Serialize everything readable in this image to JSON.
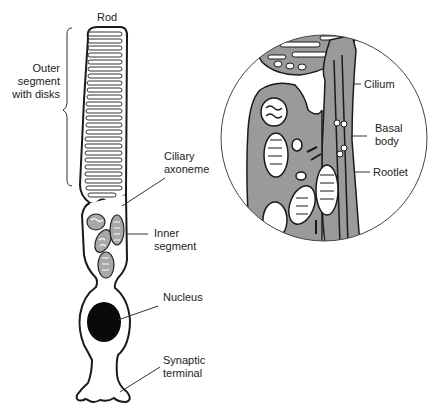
{
  "figure": {
    "title": "Rod",
    "colors": {
      "stroke": "#1a1a1a",
      "cytoplasm_gray": "#9a9a9a",
      "nucleus": "#0a0a0a",
      "background": "#ffffff"
    }
  },
  "labels": {
    "rod": "Rod",
    "outer_segment": [
      "Outer",
      "segment",
      "with disks"
    ],
    "ciliary_axoneme": [
      "Ciliary",
      "axoneme"
    ],
    "inner_segment": [
      "Inner",
      "segment"
    ],
    "nucleus": "Nucleus",
    "synaptic_terminal": [
      "Synaptic",
      "terminal"
    ]
  },
  "inset": {
    "cilium": "Cilium",
    "basal_body": [
      "Basal",
      "body"
    ],
    "rootlet": "Rootlet"
  }
}
